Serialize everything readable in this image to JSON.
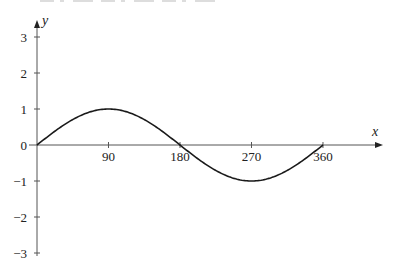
{
  "chart_data": {
    "type": "line",
    "title": "",
    "xlabel": "x",
    "ylabel": "y",
    "function": "y = sin x",
    "xlim": [
      0,
      360
    ],
    "ylim": [
      -3,
      3
    ],
    "grid": false,
    "x_ticks": [
      90,
      180,
      270,
      360
    ],
    "x_tick_labels": [
      "90",
      "180",
      "270",
      "360"
    ],
    "y_ticks": [
      3,
      2,
      1,
      0,
      -1,
      -2,
      -3
    ],
    "y_tick_labels": [
      "3",
      "2",
      "1",
      "0",
      "−1",
      "−2",
      "−3"
    ],
    "series": [
      {
        "name": "sin x",
        "x": [
          0,
          30,
          60,
          90,
          120,
          150,
          180,
          210,
          240,
          270,
          300,
          330,
          360
        ],
        "y": [
          0,
          0.5,
          0.866,
          1,
          0.866,
          0.5,
          0,
          -0.5,
          -0.866,
          -1,
          -0.866,
          -0.5,
          0
        ]
      }
    ],
    "key_points": [
      {
        "x": 0,
        "y": 0
      },
      {
        "x": 90,
        "y": 1
      },
      {
        "x": 180,
        "y": 0
      },
      {
        "x": 270,
        "y": -1
      },
      {
        "x": 360,
        "y": 0
      }
    ]
  },
  "layout": {
    "origin_px": [
      37,
      145
    ],
    "px_per_degree": 0.7944,
    "px_per_unit_y": 36,
    "x_axis_end_px": 383,
    "y_axis_top_px": 20,
    "y_axis_bottom_px": 256,
    "line_color": "#1a1a1a",
    "axis_color": "#555555"
  }
}
